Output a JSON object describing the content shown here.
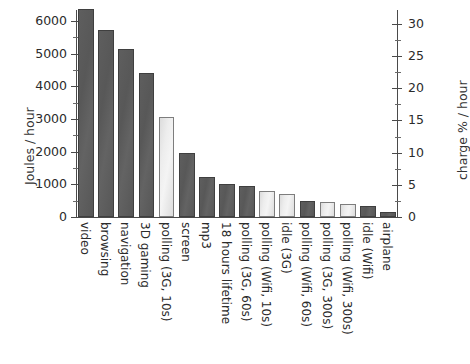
{
  "chart_data": {
    "type": "bar",
    "title": "",
    "xlabel": "",
    "ylabel": "Joules / hour",
    "y2label": "charge % / hour",
    "ylim": [
      0,
      6300
    ],
    "y2lim": [
      0,
      32
    ],
    "yticks": [
      0,
      1000,
      2000,
      3000,
      4000,
      5000,
      6000
    ],
    "yticklabels": [
      "0",
      "1000",
      "2000",
      "3000",
      "4000",
      "5000",
      "6000"
    ],
    "y2ticks": [
      0,
      5,
      10,
      15,
      20,
      25,
      30
    ],
    "y2ticklabels": [
      "0",
      "5",
      "10",
      "15",
      "20",
      "25",
      "30"
    ],
    "grid": false,
    "legend": false,
    "categories": [
      "video",
      "browsing",
      "navigation",
      "3D gaming",
      "polling (3G, 10s)",
      "screen",
      "mp3",
      "18 hours lifetime",
      "polling (3G, 60s)",
      "polling (Wifi, 10s)",
      "idle (3G)",
      "polling (Wifi, 60s)",
      "polling (3G, 300s)",
      "polling (Wifi, 300s)",
      "idle (Wifi)",
      "airplane"
    ],
    "values": [
      6350,
      5720,
      5150,
      4400,
      3070,
      1950,
      1210,
      1010,
      960,
      810,
      700,
      500,
      460,
      390,
      350,
      150
    ],
    "bar_shades": [
      "dark",
      "dark",
      "dark",
      "dark",
      "light",
      "dark",
      "dark",
      "dark",
      "dark",
      "light",
      "light",
      "dark",
      "light",
      "light",
      "dark",
      "dark"
    ],
    "colors": {
      "dark_bar": "#5a5a5a",
      "light_bar": "#e9e9e9",
      "bar_edge": "#3f3f3f",
      "axis": "#4a4a4a",
      "text": "#2b2b2b",
      "background": "#ffffff"
    }
  }
}
